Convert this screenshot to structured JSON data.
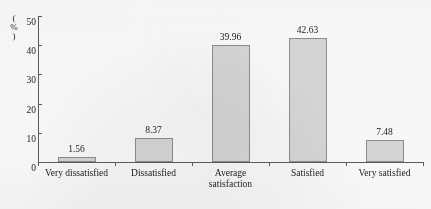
{
  "chart_data": {
    "type": "bar",
    "title": "",
    "subtitle": "",
    "xlabel": "",
    "ylabel": "(%)",
    "ylim": [
      0,
      50
    ],
    "ytick_labels": [
      "0",
      "10",
      "20",
      "30",
      "40",
      "50"
    ],
    "ytick_values": [
      0,
      10,
      20,
      30,
      40,
      50
    ],
    "grid": false,
    "legend": null,
    "categories": [
      "Very dissatisfied",
      "Dissatisfied",
      "Average satisfaction",
      "Satisfied",
      "Very satisfied"
    ],
    "category_lines": [
      [
        "Very dissatisfied"
      ],
      [
        "Dissatisfied"
      ],
      [
        "Average",
        "satisfaction"
      ],
      [
        "Satisfied"
      ],
      [
        "Very satisfied"
      ]
    ],
    "values": [
      1.56,
      8.37,
      39.96,
      42.63,
      7.48
    ],
    "value_labels": [
      "1.56",
      "8.37",
      "39.96",
      "42.63",
      "7.48"
    ],
    "bar_fill_color": "#d9d9d9",
    "bar_border_color": "#8e8e8e",
    "axis_color": "#5d5d5d",
    "text_color": "#1c1c1c"
  }
}
